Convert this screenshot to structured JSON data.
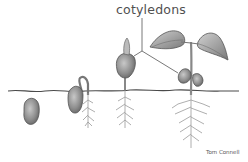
{
  "diagram": {
    "labels": {
      "cotyledons": "cotyledons"
    },
    "credit": "Tom Connell",
    "stages": [
      {
        "id": 1,
        "name": "seed"
      },
      {
        "id": 2,
        "name": "germinating seed with hooked shoot"
      },
      {
        "id": 3,
        "name": "seedling emerging with cotyledons"
      },
      {
        "id": 4,
        "name": "young plant with leaves and cotyledons"
      }
    ],
    "colors": {
      "background": "#ffffff",
      "ink": "#555555",
      "fill": "#a0a0a0",
      "soil_line": "#4a4a4a"
    }
  }
}
